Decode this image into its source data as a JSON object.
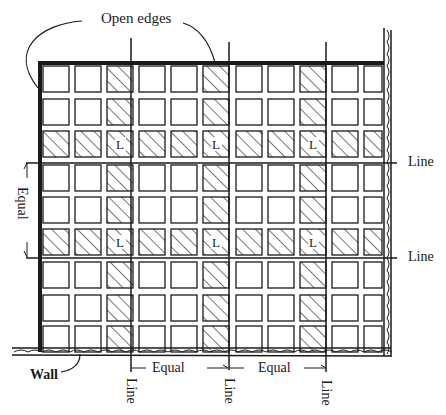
{
  "diagram": {
    "labels": {
      "open_edges": "Open edges",
      "wall": "Wall",
      "equal_left": "Equal",
      "equal_bottom_1": "Equal",
      "equal_bottom_2": "Equal",
      "line_right_1": "Line",
      "line_right_2": "Line",
      "line_bottom_1": "Line",
      "line_bottom_2": "Line",
      "line_bottom_3": "Line",
      "cell_marker": "L"
    },
    "grid": {
      "rows": 9,
      "columns": 11,
      "hatched_columns": [
        3,
        6,
        9
      ],
      "hatched_rows": [
        3,
        6
      ],
      "l_cells": [
        {
          "row": 3,
          "col": 3
        },
        {
          "row": 3,
          "col": 6
        },
        {
          "row": 3,
          "col": 9
        },
        {
          "row": 6,
          "col": 3
        },
        {
          "row": 6,
          "col": 6
        },
        {
          "row": 6,
          "col": 9
        }
      ],
      "vertical_reference_lines_x": [
        131,
        229,
        326
      ],
      "horizontal_reference_lines_y": [
        163,
        258
      ]
    },
    "colors": {
      "ink": "#1a1a1a",
      "background": "#ffffff"
    }
  }
}
